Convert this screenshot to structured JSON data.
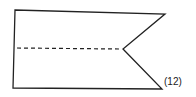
{
  "figure": {
    "label": "(12)",
    "stroke_color": "#222222",
    "shape": "swallowtail-flag",
    "outline_points": "15,10 165,14 123,49 162,89 13,88",
    "fold_line": {
      "x1": 17,
      "y1": 48,
      "x2": 120,
      "y2": 49,
      "style": "dashed"
    }
  }
}
